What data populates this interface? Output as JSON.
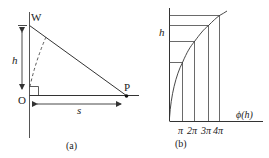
{
  "figure_a": {
    "caption": "(a)",
    "labels": {
      "top_point": "W",
      "origin": "O",
      "right_point": "P",
      "height": "h",
      "distance": "s"
    }
  },
  "figure_b": {
    "caption": "(b)",
    "y_axis_label": "h",
    "x_axis_label": "ϕ(h)",
    "x_ticks": [
      "π",
      "2π",
      "3π",
      "4π"
    ]
  },
  "colors": {
    "line": "#333333",
    "background": "#ffffff"
  }
}
